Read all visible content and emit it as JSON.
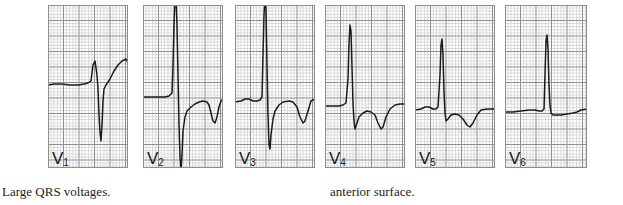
{
  "figure": {
    "background_color": "#ffffff",
    "trace_color": "#1b1b1b",
    "grid_fine_color": "#c7c7c7",
    "grid_bold_color": "#8f8f8f",
    "panel_border_color": "#8d8d8d"
  },
  "captions": {
    "left": "Large QRS voltages.",
    "right": "anterior surface."
  },
  "panels": [
    {
      "lead": "V",
      "lead_index": "1",
      "label": "V1",
      "x": 48,
      "y": 5,
      "width": 80,
      "height": 163,
      "baseline_y": 80,
      "trace": "M 0,80 L 6,79 L 14,79 L 22,80 L 30,80 L 36,79 L 40,78 L 43,76 L 45,60 L 47,56 L 49,70 L 50,84 L 51,110 L 52,128 L 53,136 L 54,120 L 55,96 L 56,84 L 58,80 L 62,74 L 66,66 L 70,60 L 74,56 L 78,54 L 80,58 L 80,80"
    },
    {
      "lead": "V",
      "lead_index": "2",
      "label": "V2",
      "x": 143,
      "y": 5,
      "width": 80,
      "height": 163,
      "baseline_y": 92,
      "trace": "M 0,92 L 8,92 L 16,92 L 22,92 L 26,91 L 29,88 L 30,60 L 31,20 L 32,-6 L 33,-10 L 34,20 L 35,70 L 36,120 L 37,152 L 38,166 L 39,150 L 40,126 L 42,112 L 44,106 L 48,102 L 52,99 L 56,97 L 60,96 L 64,97 L 66,100 L 68,108 L 70,116 L 72,118 L 74,112 L 76,102 L 78,96 L 80,94"
    },
    {
      "lead": "V",
      "lead_index": "3",
      "label": "V3",
      "x": 235,
      "y": 5,
      "width": 80,
      "height": 163,
      "baseline_y": 96,
      "trace": "M 0,97 L 6,96 L 10,94 L 14,94 L 18,96 L 22,96 L 25,95 L 27,92 L 28,50 L 29,10 L 30,-8 L 31,4 L 32,60 L 33,110 L 34,140 L 35,144 L 36,130 L 38,114 L 40,106 L 44,100 L 48,97 L 54,96 L 58,97 L 62,102 L 65,112 L 68,118 L 70,116 L 73,106 L 76,96 L 80,94"
    },
    {
      "lead": "V",
      "lead_index": "4",
      "label": "V4",
      "x": 325,
      "y": 5,
      "width": 80,
      "height": 163,
      "baseline_y": 100,
      "trace": "M 0,101 L 8,101 L 14,101 L 18,100 L 21,98 L 23,74 L 24,38 L 25,20 L 26,26 L 27,62 L 28,98 L 29,116 L 30,124 L 32,118 L 34,112 L 38,108 L 42,106 L 46,107 L 50,110 L 53,118 L 56,124 L 58,122 L 61,112 L 65,104 L 70,100 L 75,99 L 80,99"
    },
    {
      "lead": "V",
      "lead_index": "5",
      "label": "V5",
      "x": 415,
      "y": 5,
      "width": 80,
      "height": 163,
      "baseline_y": 104,
      "trace": "M 0,105 L 6,104 L 10,102 L 14,102 L 18,104 L 21,104 L 23,102 L 25,70 L 26,40 L 27,34 L 28,50 L 29,86 L 30,108 L 31,116 L 33,114 L 36,110 L 40,109 L 44,110 L 48,114 L 52,120 L 55,122 L 58,118 L 62,110 L 66,105 L 72,104 L 80,104"
    },
    {
      "lead": "V",
      "lead_index": "6",
      "label": "V6",
      "x": 505,
      "y": 5,
      "width": 82,
      "height": 163,
      "baseline_y": 106,
      "trace": "M 0,107 L 8,107 L 16,106 L 24,105 L 30,105 L 34,106 L 37,106 L 39,104 L 40,70 L 41,36 L 42,30 L 43,44 L 44,80 L 45,100 L 46,108 L 48,110 L 52,110 L 56,110 L 62,109 L 68,108 L 72,107 L 76,105 L 82,104"
    }
  ],
  "grid": {
    "fine_spacing": 3.1,
    "bold_every": 5
  }
}
